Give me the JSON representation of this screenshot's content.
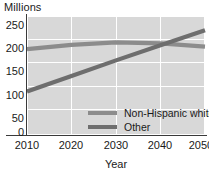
{
  "chart_data": {
    "type": "line",
    "title": "",
    "ylabel": "Millions",
    "xlabel": "Year",
    "x": [
      2010,
      2020,
      2030,
      2040,
      2050
    ],
    "xlim": [
      2010,
      2050
    ],
    "ylim": [
      0,
      250
    ],
    "yticks": [
      250,
      200,
      150,
      100,
      50,
      0
    ],
    "xticks": [
      "2010",
      "2020",
      "2030",
      "2040",
      "2050"
    ],
    "grid": true,
    "legend_position": "inside-lower-right",
    "series": [
      {
        "name": "Non-Hispanic white",
        "color": "#8c8c8c",
        "values": [
          180,
          189,
          194,
          192,
          185
        ]
      },
      {
        "name": "Other",
        "color": "#6e6e6e",
        "values": [
          90,
          123,
          156,
          188,
          220
        ]
      }
    ],
    "annotations": []
  },
  "legend": {
    "items": [
      {
        "label": "Non-Hispanic white"
      },
      {
        "label": "Other"
      }
    ]
  },
  "colors": {
    "plot_background": "#d8d8d8",
    "gridline": "#ffffff",
    "axis": "#3a3a3a",
    "text": "#1a1a1a"
  }
}
